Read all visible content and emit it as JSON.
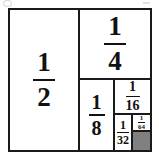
{
  "figure": {
    "outer_shape": "square",
    "border_color": "#1a1a1a",
    "background_color": "#ffffff",
    "shaded_color": "#808080"
  },
  "regions": [
    {
      "id": "half",
      "label": "1/2",
      "numerator": "1",
      "denominator": "2",
      "area_fraction": 0.5,
      "shaded": false
    },
    {
      "id": "quarter",
      "label": "1/4",
      "numerator": "1",
      "denominator": "4",
      "area_fraction": 0.25,
      "shaded": false
    },
    {
      "id": "eighth",
      "label": "1/8",
      "numerator": "1",
      "denominator": "8",
      "area_fraction": 0.125,
      "shaded": false
    },
    {
      "id": "sixteenth",
      "label": "1/16",
      "numerator": "1",
      "denominator": "16",
      "area_fraction": 0.0625,
      "shaded": false
    },
    {
      "id": "thirtysecond",
      "label": "1/32",
      "numerator": "1",
      "denominator": "32",
      "area_fraction": 0.03125,
      "shaded": false
    },
    {
      "id": "sixtyfourth",
      "label": "1/64",
      "numerator": "1",
      "denominator": "64",
      "area_fraction": 0.015625,
      "shaded": false
    },
    {
      "id": "remainder",
      "label": "",
      "numerator": "",
      "denominator": "",
      "area_fraction": 0.015625,
      "shaded": true
    }
  ],
  "artifacts": {
    "top_left_mark": "scan-speck",
    "top_right_mark": "scan-speck"
  }
}
